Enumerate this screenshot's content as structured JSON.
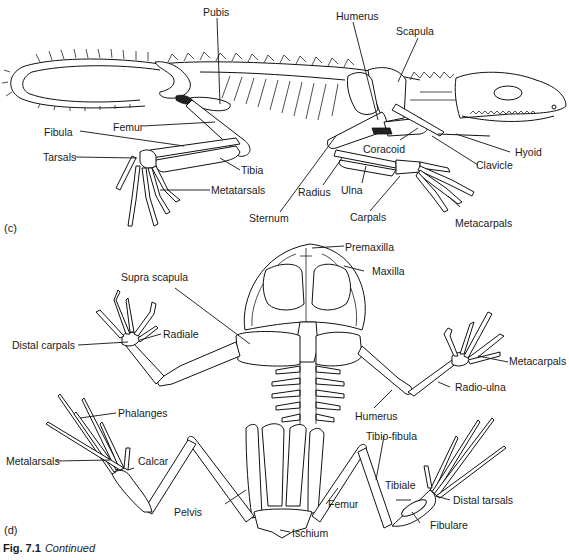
{
  "figure": {
    "caption_number": "Fig. 7.1",
    "caption_text": "Continued"
  },
  "panel_c": {
    "panel_label": "(c)",
    "subject": "lizard skeleton, lateral view",
    "labels": {
      "pubis": "Pubis",
      "humerus": "Humerus",
      "scapula": "Scapula",
      "femur": "Femur",
      "fibula": "Fibula",
      "tarsals": "Tarsals",
      "tibia": "Tibia",
      "metatarsals": "Metatarsals",
      "sternum": "Sternum",
      "coracoid": "Coracoid",
      "clavicle": "Clavicle",
      "hyoid": "Hyoid",
      "radius": "Radius",
      "ulna": "Ulna",
      "carpals": "Carpals",
      "metacarpals": "Metacarpals"
    }
  },
  "panel_d": {
    "panel_label": "(d)",
    "subject": "frog skeleton, dorsal view",
    "labels": {
      "premaxilla": "Premaxilla",
      "maxilla": "Maxilla",
      "supra_scapula": "Supra scapula",
      "radiale": "Radiale",
      "distal_carpals": "Distal carpals",
      "metacarpals": "Metacarpals",
      "radio_ulna": "Radio-ulna",
      "humerus": "Humerus",
      "phalanges": "Phalanges",
      "metatarsals": "Metalarsals",
      "calcar": "Calcar",
      "tibio_fibula": "Tibio-fibula",
      "tibiale": "Tibiale",
      "distal_tarsals": "Distal tarsals",
      "pelvis": "Pelvis",
      "femur": "Femur",
      "fibulare": "Fibulare",
      "ischium": "Ischium"
    }
  }
}
